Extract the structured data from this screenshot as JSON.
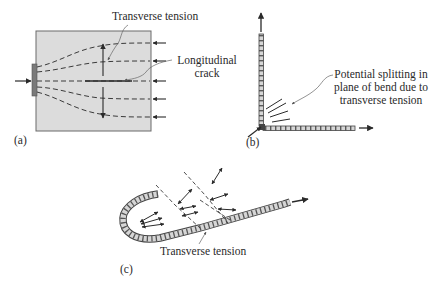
{
  "figure": {
    "colors": {
      "ink": "#2a2a2a",
      "box_fill": "#dcdcdc",
      "box_stroke": "#6a6a6a",
      "plate": "#7a7a7a",
      "bar_fill": "#cfcfcf",
      "leader": "#8a8a8a"
    },
    "panels": [
      {
        "id": "a",
        "label": "(a)",
        "annotations": {
          "transverse_tension": "Transverse tension",
          "longitudinal_line1": "Longitudinal",
          "longitudinal_line2": "crack"
        },
        "compression_arrows_right": 5,
        "stress_trajectories": 5
      },
      {
        "id": "b",
        "label": "(b)",
        "annotations": {
          "splitting_line1": "Potential splitting in",
          "splitting_line2": "plane of bend due to",
          "splitting_line3": "transverse tension"
        },
        "split_marks": 4
      },
      {
        "id": "c",
        "label": "(c)",
        "annotations": {
          "transverse_tension": "Transverse tension"
        }
      }
    ]
  }
}
